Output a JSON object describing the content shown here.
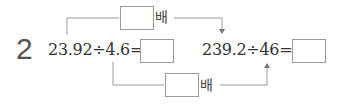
{
  "problem": {
    "number": "2",
    "left_expression": "23.92÷4.6=",
    "right_expression": "239.2÷46=",
    "top_multiplier_unit": "배",
    "bottom_multiplier_unit": "배",
    "top_answer_box": "",
    "bottom_answer_box": "",
    "left_answer_box": "",
    "right_answer_box": ""
  }
}
